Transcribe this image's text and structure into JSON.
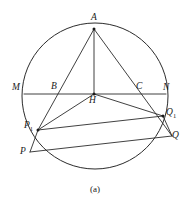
{
  "figure": {
    "caption": "(a)",
    "stroke_color": "#2b2b2b",
    "background_color": "#ffffff",
    "circle": {
      "cx": 95,
      "cy": 96,
      "r": 73
    },
    "points": {
      "A": {
        "x": 94,
        "y": 29,
        "label": "A",
        "sub": "",
        "lx": 91,
        "ly": 13
      },
      "B": {
        "x": 60,
        "y": 94,
        "label": "B",
        "sub": "",
        "lx": 51,
        "ly": 82
      },
      "C": {
        "x": 137,
        "y": 94,
        "label": "C",
        "sub": "",
        "lx": 136,
        "ly": 82
      },
      "H": {
        "x": 94,
        "y": 94,
        "label": "H",
        "sub": "",
        "lx": 89,
        "ly": 96
      },
      "M": {
        "x": 24,
        "y": 94,
        "label": "M",
        "sub": "",
        "lx": 12,
        "ly": 83
      },
      "N": {
        "x": 166,
        "y": 94,
        "label": "N",
        "sub": "",
        "lx": 163,
        "ly": 83
      },
      "P1": {
        "x": 38,
        "y": 130,
        "label": "P",
        "sub": "1",
        "lx": 24,
        "ly": 121
      },
      "Q1": {
        "x": 163,
        "y": 116,
        "label": "Q",
        "sub": "1",
        "lx": 166,
        "ly": 108
      },
      "P": {
        "x": 30,
        "y": 152,
        "label": "P",
        "sub": "",
        "lx": 20,
        "ly": 147
      },
      "Q": {
        "x": 172,
        "y": 136,
        "label": "Q",
        "sub": "",
        "lx": 172,
        "ly": 131
      }
    },
    "segments": [
      {
        "name": "chord-MN",
        "from": "M",
        "to": "N"
      },
      {
        "name": "altitude-A-H",
        "from": "A",
        "to": "H"
      },
      {
        "name": "cevian-A-P1",
        "from": "A",
        "to": "P1"
      },
      {
        "name": "cevian-A-Q",
        "from": "A",
        "to": "Q"
      },
      {
        "name": "segment-H-P1",
        "from": "H",
        "to": "P1"
      },
      {
        "name": "segment-H-Q1",
        "from": "H",
        "to": "Q1"
      },
      {
        "name": "segment-P1-Q1",
        "from": "P1",
        "to": "Q1"
      },
      {
        "name": "segment-P-Q",
        "from": "P",
        "to": "Q"
      },
      {
        "name": "segment-P1-P",
        "from": "P1",
        "to": "P"
      },
      {
        "name": "segment-Q1-Q",
        "from": "Q1",
        "to": "Q"
      }
    ],
    "vertex_dots": [
      "A",
      "H",
      "P1",
      "Q1"
    ]
  }
}
